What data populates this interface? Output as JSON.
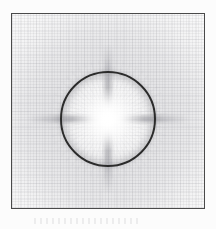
{
  "figure": {
    "kind": "scanned-grayscale-diffraction-figure",
    "title": "",
    "caption": "",
    "caption_legible": false,
    "background_color": "#fcfcfc",
    "frame": {
      "name": "plot-frame",
      "border_color": "#4a4a4a",
      "border_width_px": 1,
      "left_px": 11,
      "top_px": 13,
      "width_px": 194,
      "height_px": 196,
      "fill_color": "#fbfbfb"
    },
    "texture": {
      "name": "graph-paper-weave",
      "description": "fine orthogonal scan weave / graph-paper grid",
      "line_color": "#787880",
      "fine_pitch_px": 3,
      "coarse_pitch_px": 8
    },
    "ring": {
      "name": "dark-circle",
      "stroke_color": "#2b2b2b",
      "stroke_width_px": 2,
      "center_x_px": 108,
      "center_y_px": 119,
      "radius_px": 48,
      "diameter_px": 96
    },
    "core": {
      "name": "bright-core",
      "color": "#ffffff",
      "center_x_px": 108,
      "center_y_px": 119,
      "glow_radius_px": 48
    },
    "halo": {
      "name": "grey-halo",
      "color": "#8c8c95",
      "peak_opacity": 0.2
    },
    "spikes": {
      "name": "diffraction-spikes",
      "count": 4,
      "orientations": [
        "vertical",
        "horizontal"
      ],
      "color": "#46464f",
      "vertical_length_px": 150,
      "horizontal_length_px": 162
    }
  },
  "chart_data": {
    "type": "heatmap",
    "title": "",
    "subtitle": "",
    "xlabel": "",
    "ylabel": "",
    "grid": true,
    "legend": "none",
    "colormap": "grayscale-inverted",
    "xlim": [
      -1,
      1
    ],
    "ylim": [
      -1,
      1
    ],
    "annotations": [
      "bright central core at image centre",
      "dark circular contour ring of radius ~0.5 of half-field",
      "four-fold diffraction spikes aligned with the vertical and horizontal axes",
      "graph-paper weave texture across the whole field"
    ],
    "features": [
      {
        "name": "central peak",
        "x": 0.0,
        "y": 0.0,
        "intensity": 1.0
      },
      {
        "name": "ring minimum",
        "x": 0.0,
        "y": 0.0,
        "radius": 0.5,
        "intensity": 0.12
      },
      {
        "name": "spike-up",
        "x": 0.0,
        "y": 0.78,
        "intensity": 0.45
      },
      {
        "name": "spike-down",
        "x": 0.0,
        "y": -0.78,
        "intensity": 0.45
      },
      {
        "name": "spike-left",
        "x": -0.83,
        "y": 0.0,
        "intensity": 0.42
      },
      {
        "name": "spike-right",
        "x": 0.83,
        "y": 0.0,
        "intensity": 0.42
      },
      {
        "name": "field-background",
        "x": 0.0,
        "y": 0.0,
        "radius": 1.0,
        "intensity": 0.88
      }
    ],
    "radial_profile": {
      "r": [
        0.0,
        0.08,
        0.16,
        0.25,
        0.33,
        0.42,
        0.5,
        0.58,
        0.67,
        0.75,
        0.83,
        0.92,
        1.0
      ],
      "intensity": [
        1.0,
        0.97,
        0.86,
        0.7,
        0.52,
        0.33,
        0.12,
        0.4,
        0.58,
        0.72,
        0.82,
        0.87,
        0.9
      ]
    }
  }
}
